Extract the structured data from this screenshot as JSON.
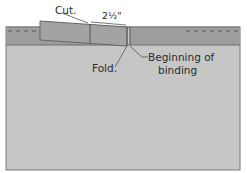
{
  "diagram": {
    "type": "quilt binding joining illustration",
    "labels": {
      "cut": "Cut.",
      "measure": "2½\"",
      "fold": "Fold.",
      "beginning_line1": "Beginning of",
      "beginning_line2": "binding"
    },
    "colors": {
      "background": "#ffffff",
      "quilt_body": "#c6c6c6",
      "binding_band": "#9d9d9d",
      "binding_tail": "#a3a3a3",
      "outline": "#6e6e6e",
      "text": "#2b2b2b"
    }
  }
}
